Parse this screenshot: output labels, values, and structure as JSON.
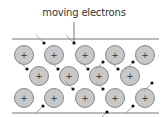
{
  "title": "moving electrons",
  "colors": {
    "ion_fill": "#c8c8c8",
    "ion_stroke": "#6e6e6e",
    "electron": "#111111",
    "line": "#555555",
    "trail": "#9a9a9a"
  },
  "ions": [
    {
      "x": 24,
      "y": 55
    },
    {
      "x": 54,
      "y": 55
    },
    {
      "x": 85,
      "y": 55
    },
    {
      "x": 115,
      "y": 55
    },
    {
      "x": 145,
      "y": 55
    },
    {
      "x": 39,
      "y": 76
    },
    {
      "x": 69,
      "y": 76
    },
    {
      "x": 99,
      "y": 76
    },
    {
      "x": 130,
      "y": 76
    },
    {
      "x": 24,
      "y": 98
    },
    {
      "x": 54,
      "y": 98
    },
    {
      "x": 85,
      "y": 98
    },
    {
      "x": 115,
      "y": 98
    },
    {
      "x": 145,
      "y": 98
    }
  ],
  "ion_symbol": "+",
  "electrons": [
    {
      "x": 44,
      "y": 43,
      "dx": -5,
      "dy": 5
    },
    {
      "x": 74,
      "y": 43,
      "dx": -5,
      "dy": 5
    },
    {
      "x": 103,
      "y": 62,
      "dx": -5,
      "dy": -5
    },
    {
      "x": 133,
      "y": 62,
      "dx": -5,
      "dy": -5
    },
    {
      "x": 27,
      "y": 69,
      "dx": -5,
      "dy": 5
    },
    {
      "x": 58,
      "y": 69,
      "dx": -5,
      "dy": 5
    },
    {
      "x": 88,
      "y": 69,
      "dx": -5,
      "dy": 5
    },
    {
      "x": 118,
      "y": 69,
      "dx": -5,
      "dy": 5
    },
    {
      "x": 152,
      "y": 83,
      "dx": -5,
      "dy": -5
    },
    {
      "x": 73,
      "y": 89,
      "dx": -5,
      "dy": 5
    },
    {
      "x": 103,
      "y": 89,
      "dx": -5,
      "dy": 5
    },
    {
      "x": 43,
      "y": 106,
      "dx": -5,
      "dy": -5
    },
    {
      "x": 133,
      "y": 106,
      "dx": -5,
      "dy": -5
    },
    {
      "x": 107,
      "y": 112,
      "dx": -5,
      "dy": -5
    }
  ]
}
